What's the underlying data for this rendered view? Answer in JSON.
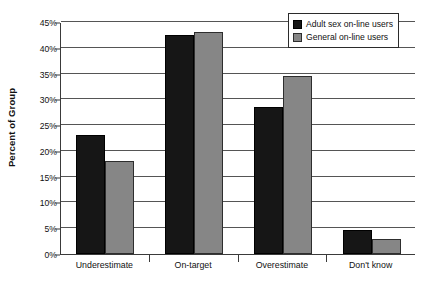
{
  "chart_data": {
    "type": "bar",
    "title": "",
    "subtitle": "",
    "xlabel": "",
    "ylabel": "Percent of Group",
    "categories": [
      "Underestimate",
      "On-target",
      "Overestimate",
      "Don't know"
    ],
    "series": [
      {
        "name": "Adult sex on-line users",
        "color": "#161616",
        "values": [
          23.0,
          42.5,
          28.5,
          4.7
        ]
      },
      {
        "name": "General on-line users",
        "color": "#868686",
        "values": [
          18.0,
          43.0,
          34.5,
          3.0
        ]
      }
    ],
    "ylim": [
      0,
      45
    ],
    "ytick_values": [
      0,
      5,
      10,
      15,
      20,
      25,
      30,
      35,
      40,
      45
    ],
    "ytick_labels": [
      "0%",
      "5%",
      "10%",
      "15%",
      "20%",
      "25%",
      "30%",
      "35%",
      "40%",
      "45%"
    ],
    "grid": true,
    "grid_axis": "y",
    "legend_position": "top-right",
    "value_format": "percent"
  },
  "colors": {
    "series_0": "#161616",
    "series_1": "#868686",
    "axis": "#3a3a3a",
    "gridline": "#555555",
    "background": "#ffffff",
    "text": "#111111"
  }
}
